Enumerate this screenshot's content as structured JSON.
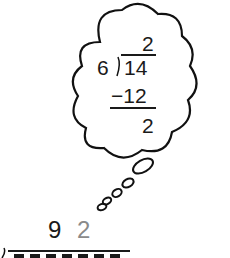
{
  "thought_bubble": {
    "quotient": "2",
    "divisor": "6",
    "dividend": "14",
    "subtraction": "−12",
    "remainder": "2"
  },
  "main_division": {
    "quotient_digits": [
      "9",
      "2"
    ],
    "quotient_colors": [
      "#1a1a1a",
      "#8a8a8a"
    ]
  }
}
